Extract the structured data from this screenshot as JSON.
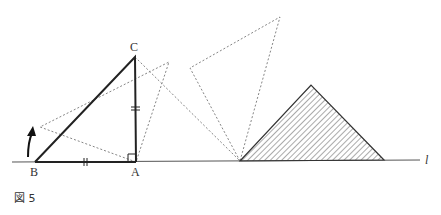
{
  "figure": {
    "caption": "図 5",
    "labels": {
      "A": "A",
      "B": "B",
      "C": "C",
      "line": "l"
    },
    "points": {
      "A": [
        136,
        162
      ],
      "B": [
        35,
        162
      ],
      "C": [
        135,
        57
      ],
      "pivot": [
        240,
        161
      ],
      "hatch_apex": [
        311,
        85
      ],
      "hatch_right": [
        384,
        160
      ],
      "rot1_p1": [
        40,
        127
      ],
      "rot1_p2": [
        169,
        62
      ],
      "rot2_p1": [
        190,
        68
      ],
      "rot2_p2": [
        280,
        17
      ]
    },
    "colors": {
      "stroke": "#222222",
      "dotted": "#777777",
      "hatch": "#444444"
    }
  }
}
